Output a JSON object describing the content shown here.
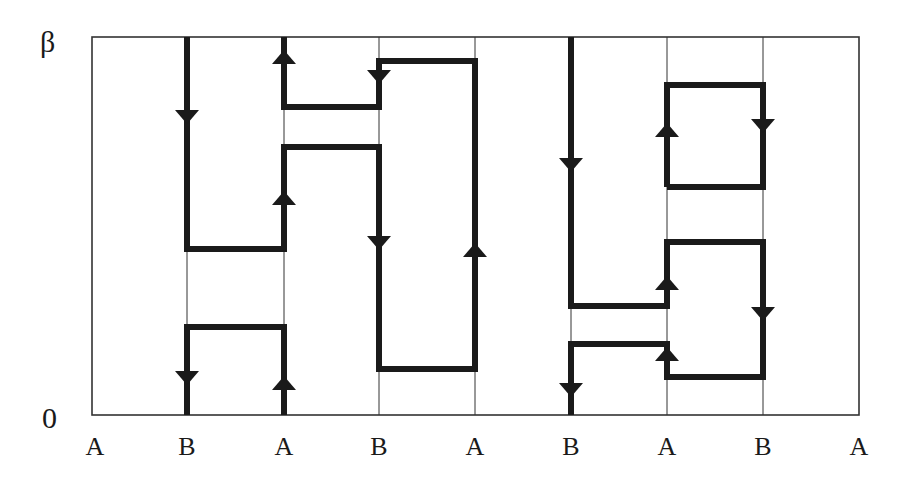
{
  "diagram": {
    "y_axis": {
      "top_label": "β",
      "bottom_label": "0"
    },
    "x_labels": [
      "A",
      "B",
      "A",
      "B",
      "A",
      "B",
      "A",
      "B",
      "A"
    ],
    "x_positions": [
      95,
      187,
      284,
      379,
      475,
      571,
      667,
      763,
      859
    ],
    "frame": {
      "left": 92,
      "top": 37,
      "right": 859,
      "bottom": 415
    },
    "grid_x": [
      187,
      284,
      379,
      475,
      571,
      667,
      763
    ],
    "colors": {
      "line": "#1a1a1a",
      "grid": "#333333",
      "background": "#ffffff"
    },
    "paths": [
      {
        "name": "path-left-main",
        "points": [
          [
            187,
            37
          ],
          [
            187,
            249
          ],
          [
            284,
            249
          ],
          [
            284,
            147
          ],
          [
            379,
            147
          ],
          [
            379,
            369
          ],
          [
            475,
            369
          ],
          [
            475,
            61
          ],
          [
            379,
            61
          ],
          [
            379,
            107
          ],
          [
            284,
            107
          ],
          [
            284,
            37
          ]
        ]
      },
      {
        "name": "path-left-bottom",
        "points": [
          [
            187,
            415
          ],
          [
            187,
            327
          ],
          [
            284,
            327
          ],
          [
            284,
            415
          ]
        ]
      },
      {
        "name": "path-right-main",
        "points": [
          [
            571,
            37
          ],
          [
            571,
            306
          ],
          [
            667,
            306
          ],
          [
            667,
            242
          ],
          [
            763,
            242
          ],
          [
            763,
            377
          ],
          [
            667,
            377
          ],
          [
            667,
            344
          ],
          [
            571,
            344
          ],
          [
            571,
            415
          ]
        ]
      },
      {
        "name": "path-right-square",
        "points": [
          [
            667,
            187
          ],
          [
            667,
            85
          ],
          [
            763,
            85
          ],
          [
            763,
            187
          ],
          [
            667,
            187
          ]
        ]
      }
    ],
    "arrows": [
      {
        "x": 187,
        "y": 117,
        "dir": "down"
      },
      {
        "x": 284,
        "y": 57,
        "dir": "up"
      },
      {
        "x": 379,
        "y": 77,
        "dir": "down"
      },
      {
        "x": 284,
        "y": 198,
        "dir": "up"
      },
      {
        "x": 379,
        "y": 243,
        "dir": "down"
      },
      {
        "x": 475,
        "y": 250,
        "dir": "up"
      },
      {
        "x": 187,
        "y": 378,
        "dir": "down"
      },
      {
        "x": 284,
        "y": 383,
        "dir": "up"
      },
      {
        "x": 571,
        "y": 165,
        "dir": "down"
      },
      {
        "x": 667,
        "y": 130,
        "dir": "up"
      },
      {
        "x": 763,
        "y": 126,
        "dir": "down"
      },
      {
        "x": 667,
        "y": 283,
        "dir": "up"
      },
      {
        "x": 763,
        "y": 314,
        "dir": "down"
      },
      {
        "x": 667,
        "y": 354,
        "dir": "up"
      },
      {
        "x": 571,
        "y": 390,
        "dir": "down"
      }
    ]
  }
}
